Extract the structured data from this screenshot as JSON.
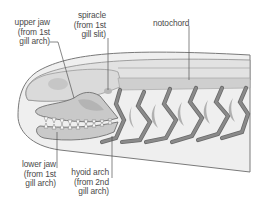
{
  "diagram": {
    "labels": {
      "upper_jaw": [
        "upper jaw",
        "(from 1st",
        "gill arch)"
      ],
      "spiracle": [
        "spiracle",
        "(from 1st",
        "gill slit)"
      ],
      "notochord": [
        "notochord"
      ],
      "lower_jaw": [
        "lower jaw",
        "(from 1st",
        "gill arch)"
      ],
      "hyoid_arch": [
        "hyoid arch",
        "(from 2nd",
        "gill arch)"
      ]
    },
    "colors": {
      "outline": "#6b6b6b",
      "body_fill": "#ebebeb",
      "inner_fill": "#dcdcdc",
      "notochord_fill": "#cfcfcf",
      "jaw_fill": "#c4c4c4",
      "arch_fill": "#7a7a7a",
      "gill_slit_fill": "#a8a8a8",
      "label_text": "#4a4a4a"
    },
    "gill_arch_count": 5
  }
}
